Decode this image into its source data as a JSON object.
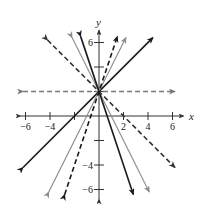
{
  "chart_data": {
    "type": "line",
    "title": "",
    "xlabel": "x",
    "ylabel": "y",
    "xlim": [
      -6.5,
      6.5
    ],
    "ylim": [
      -6.5,
      6.5
    ],
    "x_ticks": [
      -6,
      -4,
      -2,
      2,
      4,
      6
    ],
    "x_tick_labels": [
      "-6",
      "-4",
      "",
      "2",
      "4",
      "6"
    ],
    "y_ticks": [
      -6,
      -4,
      -2,
      2,
      4,
      6
    ],
    "y_tick_labels": [
      "-6",
      "-4",
      "",
      "",
      "",
      "6"
    ],
    "grid": false,
    "legend": null,
    "series": [
      {
        "name": "y = 2",
        "slope": 0,
        "intercept": 2,
        "style": "dashed",
        "color": "#777777",
        "x_range": [
          -6.2,
          6.2
        ]
      },
      {
        "name": "y = x + 2",
        "slope": 1,
        "intercept": 2,
        "style": "solid",
        "color": "#1a1a1a",
        "x_range": [
          -6.2,
          4.4
        ]
      },
      {
        "name": "y = -x + 2",
        "slope": -1,
        "intercept": 2,
        "style": "dashed",
        "color": "#333333",
        "x_range": [
          -4.2,
          6.2
        ]
      },
      {
        "name": "y = 2x + 2",
        "slope": 2,
        "intercept": 2,
        "style": "solid",
        "color": "#8a8a8a",
        "x_range": [
          -4.1,
          2.2
        ]
      },
      {
        "name": "y = -2x + 2",
        "slope": -2,
        "intercept": 2,
        "style": "solid",
        "color": "#8a8a8a",
        "x_range": [
          -2.2,
          4.1
        ]
      },
      {
        "name": "y = 3x + 2",
        "slope": 3,
        "intercept": 2,
        "style": "dashed",
        "color": "#1a1a1a",
        "x_range": [
          -2.8,
          1.5
        ]
      },
      {
        "name": "y = -3x + 2",
        "slope": -3,
        "intercept": 2,
        "style": "solid",
        "color": "#1a1a1a",
        "x_range": [
          -1.5,
          2.8
        ]
      }
    ]
  }
}
